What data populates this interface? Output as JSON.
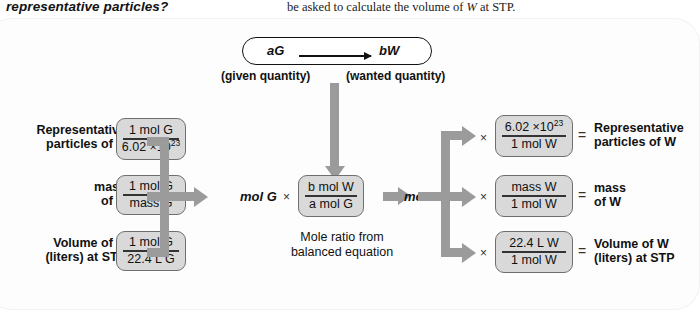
{
  "page_text": {
    "top_left": "representative particles?",
    "top_right_prefix": "be asked to calculate the volume of ",
    "top_right_var": "W",
    "top_right_suffix": " at STP."
  },
  "equation": {
    "given_term": "aG",
    "wanted_term": "bW",
    "given_label": "(given quantity)",
    "wanted_label": "(wanted quantity)",
    "arrow_icon": "right-arrow-icon"
  },
  "center": {
    "mol_given": "mol G",
    "mol_wanted": "mol W",
    "times": "×",
    "ratio_numerator": "b mol W",
    "ratio_denominator": "a mol G",
    "caption_line1": "Mole ratio from",
    "caption_line2": "balanced equation"
  },
  "left_rows": [
    {
      "label_line1": "Representative",
      "label_line2": "particles of G",
      "operator": "×",
      "numerator": "1 mol G",
      "denominator_base": "6.02 ×10",
      "denominator_exp": "23"
    },
    {
      "label_line1": "mass",
      "label_line2": "of G",
      "operator": "×",
      "numerator": "1 mol G",
      "denominator_base": "mass G",
      "denominator_exp": ""
    },
    {
      "label_line1": "Volume of G",
      "label_line2": "(liters) at STP",
      "operator": "×",
      "numerator": "1 mol G",
      "denominator_base": "22.4 L G",
      "denominator_exp": ""
    }
  ],
  "right_rows": [
    {
      "operator": "×",
      "numerator_base": "6.02 ×10",
      "numerator_exp": "23",
      "denominator": "1 mol W",
      "equals": "=",
      "label_line1": "Representative",
      "label_line2": "particles of W"
    },
    {
      "operator": "×",
      "numerator_base": "mass W",
      "numerator_exp": "",
      "denominator": "1 mol W",
      "equals": "=",
      "label_line1": "mass",
      "label_line2": "of W"
    },
    {
      "operator": "×",
      "numerator_base": "22.4 L W",
      "numerator_exp": "",
      "denominator": "1 mol W",
      "equals": "=",
      "label_line1": "Volume of W",
      "label_line2": "(liters) at STP"
    }
  ],
  "colors": {
    "box_fill": "#d9d9d9",
    "box_border": "#6f6f6f",
    "arrow_gray": "#9b9b9b",
    "text": "#111111",
    "panel_bg": "#fdfdfd"
  }
}
